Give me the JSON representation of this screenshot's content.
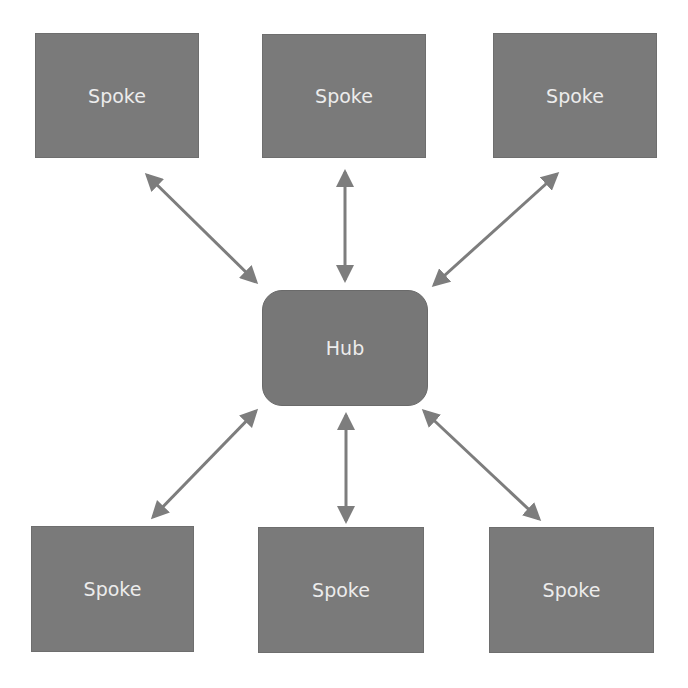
{
  "diagram": {
    "type": "hub-and-spoke",
    "colors": {
      "node_fill": "#7a7a7a",
      "node_text": "#ececec",
      "arrow": "#7d7d7d",
      "background": "#ffffff"
    },
    "hub": {
      "label": "Hub"
    },
    "spokes": [
      {
        "label": "Spoke",
        "position": "top-left"
      },
      {
        "label": "Spoke",
        "position": "top-center"
      },
      {
        "label": "Spoke",
        "position": "top-right"
      },
      {
        "label": "Spoke",
        "position": "bottom-left"
      },
      {
        "label": "Spoke",
        "position": "bottom-center"
      },
      {
        "label": "Spoke",
        "position": "bottom-right"
      }
    ],
    "connections": [
      {
        "from": "Hub",
        "to": "top-left",
        "bidirectional": true
      },
      {
        "from": "Hub",
        "to": "top-center",
        "bidirectional": true
      },
      {
        "from": "Hub",
        "to": "top-right",
        "bidirectional": true
      },
      {
        "from": "Hub",
        "to": "bottom-left",
        "bidirectional": true
      },
      {
        "from": "Hub",
        "to": "bottom-center",
        "bidirectional": true
      },
      {
        "from": "Hub",
        "to": "bottom-right",
        "bidirectional": true
      }
    ]
  }
}
